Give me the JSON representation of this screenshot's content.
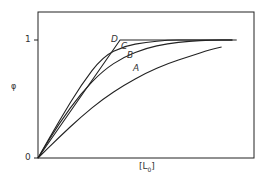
{
  "chart_data": {
    "type": "line",
    "title": "",
    "xlabel": "[L0]",
    "ylabel": "φ",
    "ylim": [
      0,
      1.2
    ],
    "xlim": [
      0,
      1.0
    ],
    "yticks": [
      "0",
      "1"
    ],
    "xticks": [],
    "grid": false,
    "legend": "inline curve labels",
    "series": [
      {
        "name": "A",
        "x": [
          0,
          0.1,
          0.2,
          0.3,
          0.4,
          0.5,
          0.6,
          0.7,
          0.8,
          0.85
        ],
        "y": [
          0,
          0.18,
          0.35,
          0.5,
          0.62,
          0.72,
          0.8,
          0.86,
          0.92,
          0.94
        ]
      },
      {
        "name": "B",
        "x": [
          0,
          0.1,
          0.2,
          0.3,
          0.4,
          0.5,
          0.6,
          0.7,
          0.8,
          0.9
        ],
        "y": [
          0,
          0.3,
          0.55,
          0.74,
          0.86,
          0.93,
          0.97,
          0.99,
          1.0,
          1.0
        ]
      },
      {
        "name": "C",
        "x": [
          0,
          0.1,
          0.2,
          0.3,
          0.4,
          0.5,
          0.6,
          0.7,
          0.9
        ],
        "y": [
          0,
          0.32,
          0.62,
          0.86,
          0.95,
          0.98,
          1.0,
          1.0,
          1.0
        ]
      },
      {
        "name": "D",
        "x": [
          0,
          0.38,
          0.92
        ],
        "y": [
          0,
          1.0,
          1.0
        ]
      }
    ]
  },
  "axes": {
    "y_tick_0": "0",
    "y_tick_1": "1",
    "y_label": "φ",
    "x_label": "[L",
    "x_label_sub": "0",
    "x_label_close": "]"
  },
  "curve_labels": {
    "A": "A",
    "B": "B",
    "C": "C",
    "D": "D"
  }
}
